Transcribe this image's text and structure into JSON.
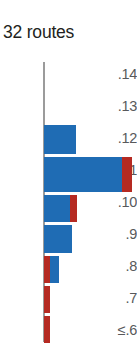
{
  "chart_title": "32 routes",
  "colors": {
    "blue": "#1f6cb4",
    "red": "#b52a22",
    "axis": "#9b9b9b",
    "label": "#58595b",
    "title": "#231f20"
  },
  "axis": {
    "tick_labels": [
      ".14",
      ".13",
      ".12",
      ".11",
      ".10",
      ".9",
      ".8",
      ".7",
      "≤.6"
    ]
  },
  "chart_data": {
    "type": "bar",
    "orientation": "horizontal",
    "title": "32 routes",
    "xlabel": "",
    "ylabel": "",
    "grid": false,
    "legend_position": "none",
    "categories": [
      ".14",
      ".13",
      ".12",
      ".11",
      ".10",
      ".9",
      ".8",
      ".7",
      "≤.6"
    ],
    "series": [
      {
        "name": "blue",
        "color": "#1f6cb4",
        "values": [
          0,
          0,
          4,
          13,
          3,
          3,
          1,
          0,
          0
        ]
      },
      {
        "name": "red",
        "color": "#b52a22",
        "values": [
          0,
          0,
          0,
          2,
          1,
          0,
          1,
          1,
          1
        ]
      }
    ],
    "stacked": true,
    "totals": [
      0,
      0,
      4,
      15,
      4,
      3,
      2,
      1,
      1
    ],
    "xlim": [
      0,
      15
    ]
  },
  "bars": [
    {
      "label": ".14",
      "top": 0,
      "height": 0,
      "segments": []
    },
    {
      "label": ".13",
      "top": 0,
      "height": 0,
      "segments": []
    },
    {
      "label": ".12",
      "top": 63,
      "height": 29,
      "segments": [
        {
          "type": "blue",
          "x": 0,
          "w": 32
        }
      ]
    },
    {
      "label": ".11",
      "top": 95,
      "height": 35,
      "segments": [
        {
          "type": "blue",
          "x": 0,
          "w": 78
        },
        {
          "type": "red",
          "x": 78,
          "w": 10
        }
      ]
    },
    {
      "label": ".10",
      "top": 133,
      "height": 27,
      "segments": [
        {
          "type": "blue",
          "x": 0,
          "w": 26
        },
        {
          "type": "red",
          "x": 26,
          "w": 7
        }
      ]
    },
    {
      "label": ".9",
      "top": 163,
      "height": 28,
      "segments": [
        {
          "type": "blue",
          "x": 0,
          "w": 28
        }
      ]
    },
    {
      "label": ".8",
      "top": 194,
      "height": 27,
      "segments": [
        {
          "type": "red",
          "x": 0,
          "w": 6
        },
        {
          "type": "blue",
          "x": 6,
          "w": 9
        }
      ]
    },
    {
      "label": ".7",
      "top": 224,
      "height": 27,
      "segments": [
        {
          "type": "red",
          "x": 0,
          "w": 6
        }
      ]
    },
    {
      "label": "≤.6",
      "top": 254,
      "height": 27,
      "segments": [
        {
          "type": "red",
          "x": 0,
          "w": 6
        }
      ]
    }
  ],
  "tick_positions": [
    4,
    36,
    68,
    100,
    132,
    164,
    196,
    228,
    260
  ]
}
